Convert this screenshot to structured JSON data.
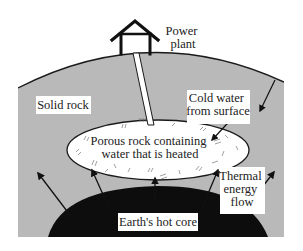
{
  "diagram": {
    "type": "geothermal-energy-cross-section",
    "labels": {
      "power_plant_line1": "Power",
      "power_plant_line2": "plant",
      "cold_water_line1": "Cold water",
      "cold_water_line2": "from surface",
      "solid_rock": "Solid rock",
      "porous_line1": "Porous rock containing",
      "porous_line2": "water that is heated",
      "thermal_line1": "Thermal",
      "thermal_line2": "energy",
      "thermal_line3": "flow",
      "core": "Earth's hot core"
    },
    "colors": {
      "rock": "#b9b9b9",
      "core": "#0d0d0d",
      "reservoir": "#ffffff",
      "line": "#1a1a1a"
    }
  }
}
